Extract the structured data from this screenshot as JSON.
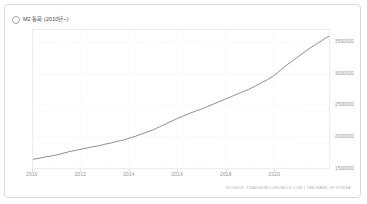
{
  "card": {
    "title": "M2 통화 (2010년~)",
    "series_icon": "circle-marker-icon",
    "source": "SOURCE: TRADINGECONOMICS.COM | THE BANK OF KOREA"
  },
  "chart_data": {
    "type": "line",
    "title": "M2 통화 (2010년~)",
    "xlabel": "",
    "ylabel": "",
    "grid": true,
    "legend": "none",
    "line_color": "#6b7075",
    "xlim": [
      2010.0,
      2022.3
    ],
    "ylim": [
      1500000,
      3700000
    ],
    "ytick_labels": [
      "3500000",
      "3000000",
      "2500000",
      "2000000",
      "1500000"
    ],
    "yticks": [
      3500000,
      3000000,
      2500000,
      2000000,
      1500000
    ],
    "xtick_labels": [
      "2010",
      "2012",
      "2014",
      "2016",
      "2018",
      "2020"
    ],
    "xticks": [
      2010,
      2012,
      2014,
      2016,
      2018,
      2020
    ],
    "series": [
      {
        "name": "M2 통화",
        "x": [
          2010.0,
          2010.25,
          2010.5,
          2010.75,
          2011.0,
          2011.25,
          2011.5,
          2011.75,
          2012.0,
          2012.25,
          2012.5,
          2012.75,
          2013.0,
          2013.25,
          2013.5,
          2013.75,
          2014.0,
          2014.25,
          2014.5,
          2014.75,
          2015.0,
          2015.25,
          2015.5,
          2015.75,
          2016.0,
          2016.25,
          2016.5,
          2016.75,
          2017.0,
          2017.25,
          2017.5,
          2017.75,
          2018.0,
          2018.25,
          2018.5,
          2018.75,
          2019.0,
          2019.25,
          2019.5,
          2019.75,
          2020.0,
          2020.25,
          2020.5,
          2020.75,
          2021.0,
          2021.25,
          2021.5,
          2021.75,
          2022.0,
          2022.15,
          2022.3
        ],
        "values": [
          1640000,
          1655000,
          1675000,
          1690000,
          1710000,
          1735000,
          1760000,
          1780000,
          1800000,
          1820000,
          1840000,
          1855000,
          1880000,
          1900000,
          1925000,
          1945000,
          1975000,
          2005000,
          2040000,
          2075000,
          2110000,
          2155000,
          2200000,
          2245000,
          2290000,
          2330000,
          2370000,
          2405000,
          2440000,
          2480000,
          2520000,
          2560000,
          2600000,
          2640000,
          2680000,
          2720000,
          2760000,
          2810000,
          2860000,
          2910000,
          2970000,
          3050000,
          3130000,
          3200000,
          3270000,
          3340000,
          3410000,
          3470000,
          3530000,
          3570000,
          3600000
        ]
      }
    ]
  }
}
